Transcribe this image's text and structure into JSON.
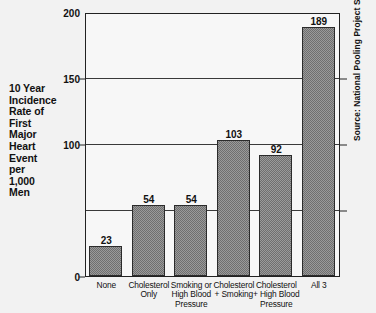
{
  "chart_data": {
    "type": "bar",
    "title": "",
    "xlabel": "",
    "ylabel": "10 Year Incidence Rate of First Major Heart Event per 1,000 Men",
    "ylim": [
      0,
      200
    ],
    "yticks": [
      0,
      50,
      100,
      150,
      200
    ],
    "ytick_labels": [
      "0",
      "",
      "100",
      "150",
      "200"
    ],
    "grid": true,
    "legend": null,
    "categories": [
      "None",
      "Cholesterol Only",
      "Smoking or High Blood Pressure",
      "Cholesterol + Smoking",
      "Cholesterol + High Blood Pressure",
      "All 3"
    ],
    "values": [
      23,
      54,
      54,
      103,
      92,
      189
    ],
    "annotations": [
      "Source: National Pooling Project Study"
    ]
  },
  "ylabel_lines": [
    "10 Year",
    "Incidence",
    "Rate of",
    "First",
    "Major",
    "Heart",
    "Event",
    "per",
    "1,000",
    "Men"
  ],
  "ytick_labels": [
    "200",
    "150",
    "100",
    "0"
  ],
  "bars": [
    {
      "value": 23,
      "label": "23",
      "cat_lines": [
        "None"
      ]
    },
    {
      "value": 54,
      "label": "54",
      "cat_lines": [
        "Cholesterol",
        "Only"
      ]
    },
    {
      "value": 54,
      "label": "54",
      "cat_lines": [
        "Smoking or",
        "High Blood",
        "Pressure"
      ]
    },
    {
      "value": 103,
      "label": "103",
      "cat_lines": [
        "Cholesterol",
        "+ Smoking"
      ]
    },
    {
      "value": 92,
      "label": "92",
      "cat_lines": [
        "Cholesterol",
        "+ High Blood",
        "Pressure"
      ]
    },
    {
      "value": 189,
      "label": "189",
      "cat_lines": [
        "All 3"
      ]
    }
  ],
  "source": "Source: National Pooling Project Study",
  "colors": {
    "background": "#f2f2f2",
    "plot_background": "#f7f7f7",
    "bar_fill": "#9a9a9a",
    "bar_border": "#2b2b2b",
    "axis": "#222222",
    "gridline": "#3a3a3a",
    "text": "#111111"
  }
}
